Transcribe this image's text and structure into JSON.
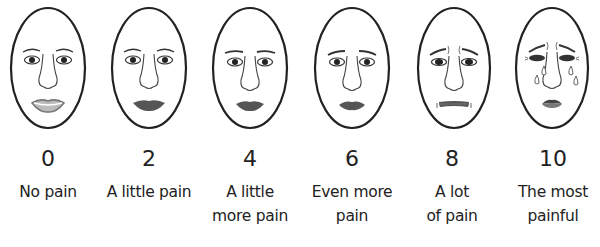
{
  "colors": {
    "stroke": "#222222",
    "lip": "#555555",
    "background": "#ffffff"
  },
  "items": [
    {
      "score": "0",
      "label_line1": "No pain",
      "label_line2": "",
      "expression": "smile"
    },
    {
      "score": "2",
      "label_line1": "A little pain",
      "label_line2": "",
      "expression": "neutral-lips"
    },
    {
      "score": "4",
      "label_line1": "A little",
      "label_line2": "more pain",
      "expression": "neutral-lips"
    },
    {
      "score": "6",
      "label_line1": "Even more",
      "label_line2": "pain",
      "expression": "slight-frown"
    },
    {
      "score": "8",
      "label_line1": "A lot",
      "label_line2": "of pain",
      "expression": "grimace"
    },
    {
      "score": "10",
      "label_line1": "The most",
      "label_line2": "painful",
      "expression": "crying"
    }
  ]
}
